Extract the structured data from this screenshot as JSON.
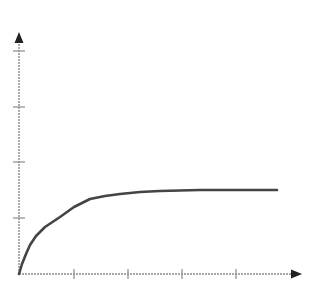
{
  "chart_data": {
    "type": "line",
    "title": "",
    "xlabel": "",
    "ylabel": "",
    "x_ticks": 4,
    "y_ticks": 4,
    "tick_labels": false,
    "grid": false,
    "legend": null,
    "xlim": [
      0,
      5.3
    ],
    "ylim": [
      0,
      4.3
    ],
    "series": [
      {
        "name": "curve",
        "x": [
          0,
          0.06,
          0.13,
          0.2,
          0.31,
          0.48,
          0.76,
          1.02,
          1.31,
          1.59,
          1.87,
          2.24,
          2.61,
          3.35,
          4.78
        ],
        "y": [
          0,
          0.18,
          0.36,
          0.52,
          0.68,
          0.84,
          1.02,
          1.2,
          1.34,
          1.39,
          1.43,
          1.46,
          1.48,
          1.5,
          1.5
        ]
      }
    ]
  },
  "style": {
    "axis_color": "#8a8a8a",
    "arrow_color": "#222222",
    "curve_color": "#444444"
  },
  "geometry": {
    "origin": [
      19,
      274
    ],
    "x_axis_end": 302,
    "y_axis_end": 32,
    "x_tick_positions": [
      74,
      128,
      182,
      236
    ],
    "y_tick_positions": [
      218,
      162,
      107,
      51
    ],
    "curve_points": "19,274 22,264 26,254 30,245 36,236 45,227 60,217 74,207 90,199 105,196 120,194 140,192 160,191 200,190 277,190"
  }
}
